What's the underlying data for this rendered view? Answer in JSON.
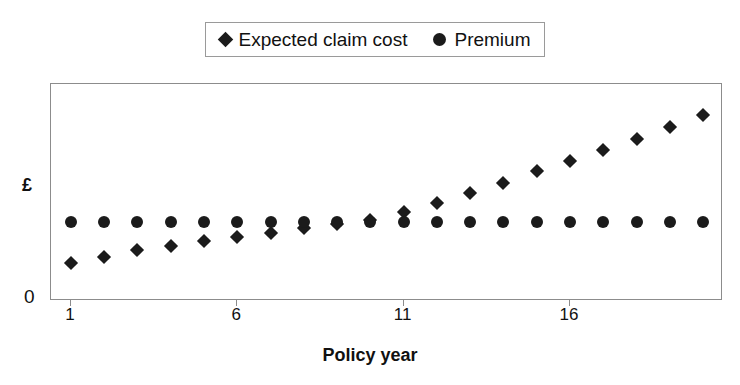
{
  "chart_data": {
    "type": "scatter",
    "title": "",
    "xlabel": "Policy year",
    "ylabel": "£",
    "x": [
      1,
      2,
      3,
      4,
      5,
      6,
      7,
      8,
      9,
      10,
      11,
      12,
      13,
      14,
      15,
      16,
      17,
      18,
      19,
      20
    ],
    "xtick_values": [
      1,
      6,
      11,
      16
    ],
    "xtick_labels": [
      "1",
      "6",
      "11",
      "16"
    ],
    "ytick_labels": [
      "0"
    ],
    "xlim": [
      0.4,
      20.6
    ],
    "ylim": [
      0,
      1
    ],
    "grid": false,
    "legend_position": "top-center",
    "series": [
      {
        "name": "Expected claim cost",
        "marker": "diamond",
        "color": "#1b1b1b",
        "values": [
          0.175,
          0.205,
          0.235,
          0.255,
          0.275,
          0.295,
          0.315,
          0.335,
          0.355,
          0.375,
          0.41,
          0.45,
          0.5,
          0.545,
          0.6,
          0.645,
          0.695,
          0.745,
          0.8,
          0.855
        ]
      },
      {
        "name": "Premium",
        "marker": "circle",
        "color": "#1b1b1b",
        "values": [
          0.365,
          0.365,
          0.365,
          0.365,
          0.365,
          0.365,
          0.365,
          0.365,
          0.365,
          0.365,
          0.365,
          0.365,
          0.365,
          0.365,
          0.365,
          0.365,
          0.365,
          0.365,
          0.365,
          0.365
        ]
      }
    ]
  },
  "legend": {
    "entries": [
      {
        "label": "Expected claim cost",
        "marker": "diamond"
      },
      {
        "label": "Premium",
        "marker": "circle"
      }
    ]
  },
  "axes": {
    "y_label": "£",
    "y_zero": "0",
    "x_title": "Policy year"
  }
}
